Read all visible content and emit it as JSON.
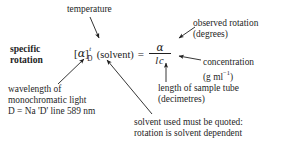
{
  "diagram": {
    "title_label": "specific rotation",
    "background_color": "#ffffff",
    "ink_color": "#1f1f1f",
    "equation": {
      "open_bracket": "[",
      "alpha_symbol": "α",
      "close_bracket": "]",
      "superscript_temperature": "t",
      "subscript_wavelength": "D",
      "solvent_term": "(solvent)",
      "equals": "=",
      "numerator": "α",
      "denominator_length": "l",
      "denominator_concentration": "c"
    },
    "labels": {
      "temperature": "temperature",
      "observed_rotation_line1": "observed rotation",
      "observed_rotation_line2": "(degrees)",
      "concentration_line1": "concentration",
      "concentration_units_prefix": "(g ml",
      "concentration_units_exponent": "−1",
      "concentration_units_suffix": ")",
      "length_line1": "length of sample tube",
      "length_line2": "(decimetres)",
      "wavelength_line1": "wavelength of",
      "wavelength_line2": "monochromatic light",
      "wavelength_line3": "D = Na 'D' line 589 nm",
      "solvent_note_line1": "solvent used must be quoted:",
      "solvent_note_line2": "rotation is solvent dependent"
    },
    "arrows": [
      {
        "name": "temperature-arrow",
        "x1": 90,
        "y1": 17,
        "x2": 99,
        "y2": 39
      },
      {
        "name": "wavelength-arrow",
        "x1": 58,
        "y1": 84,
        "x2": 84,
        "y2": 58
      },
      {
        "name": "solvent-arrow",
        "x1": 152,
        "y1": 114,
        "x2": 107,
        "y2": 59
      },
      {
        "name": "observed-rotation-arrow",
        "x1": 195,
        "y1": 27,
        "x2": 178,
        "y2": 38
      },
      {
        "name": "concentration-arrow",
        "x1": 200,
        "y1": 60,
        "x2": 178,
        "y2": 57
      },
      {
        "name": "length-arrow",
        "x1": 166,
        "y1": 82,
        "x2": 166,
        "y2": 62
      }
    ]
  }
}
